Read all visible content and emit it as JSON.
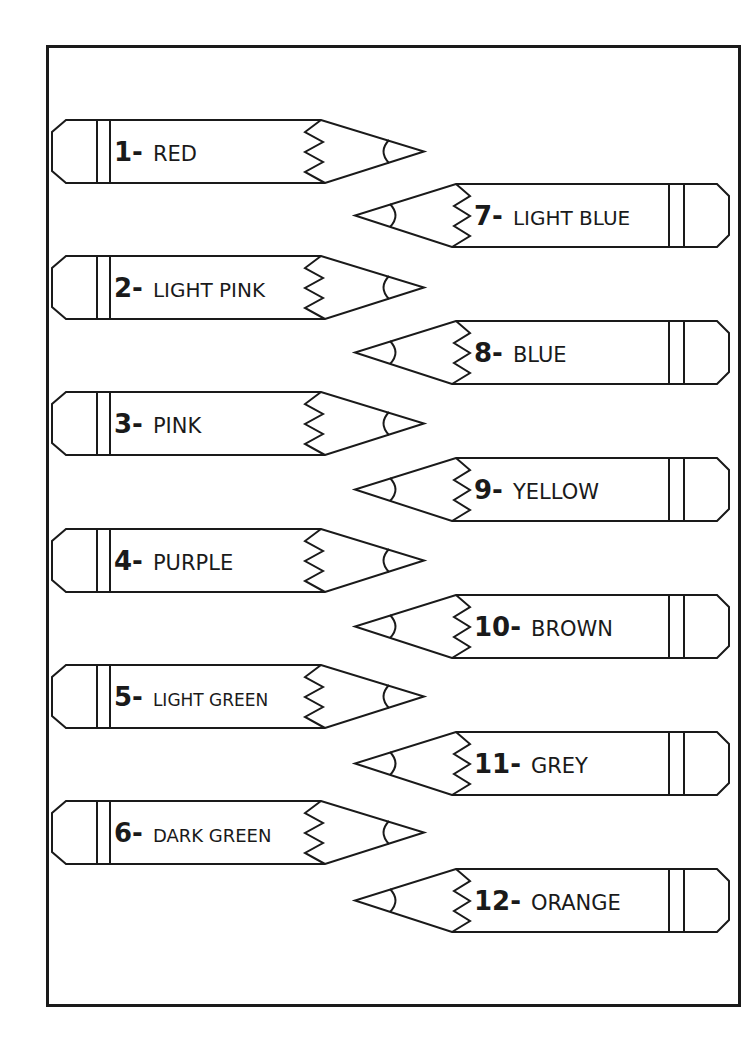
{
  "worksheet": {
    "type": "color-key pencils",
    "pencils": [
      {
        "number": "1-",
        "name": "RED",
        "side": "left",
        "top": 120,
        "name_size": 21
      },
      {
        "number": "2-",
        "name": "LIGHT PINK",
        "side": "left",
        "top": 256,
        "name_size": 20
      },
      {
        "number": "3-",
        "name": "PINK",
        "side": "left",
        "top": 392,
        "name_size": 21
      },
      {
        "number": "4-",
        "name": "PURPLE",
        "side": "left",
        "top": 529,
        "name_size": 21
      },
      {
        "number": "5-",
        "name": "LIGHT GREEN",
        "side": "left",
        "top": 665,
        "name_size": 17
      },
      {
        "number": "6-",
        "name": "DARK GREEN",
        "side": "left",
        "top": 801,
        "name_size": 18
      },
      {
        "number": "7-",
        "name": "LIGHT BLUE",
        "side": "right",
        "top": 184,
        "name_size": 20
      },
      {
        "number": "8-",
        "name": "BLUE",
        "side": "right",
        "top": 321,
        "name_size": 21
      },
      {
        "number": "9-",
        "name": "YELLOW",
        "side": "right",
        "top": 458,
        "name_size": 21
      },
      {
        "number": "10-",
        "name": "BROWN",
        "side": "right",
        "top": 595,
        "name_size": 21
      },
      {
        "number": "11-",
        "name": "GREY",
        "side": "right",
        "top": 732,
        "name_size": 21
      },
      {
        "number": "12-",
        "name": "ORANGE",
        "side": "right",
        "top": 869,
        "name_size": 21
      }
    ]
  },
  "colors": {
    "line": "#1a1a1a",
    "paper": "#ffffff"
  }
}
